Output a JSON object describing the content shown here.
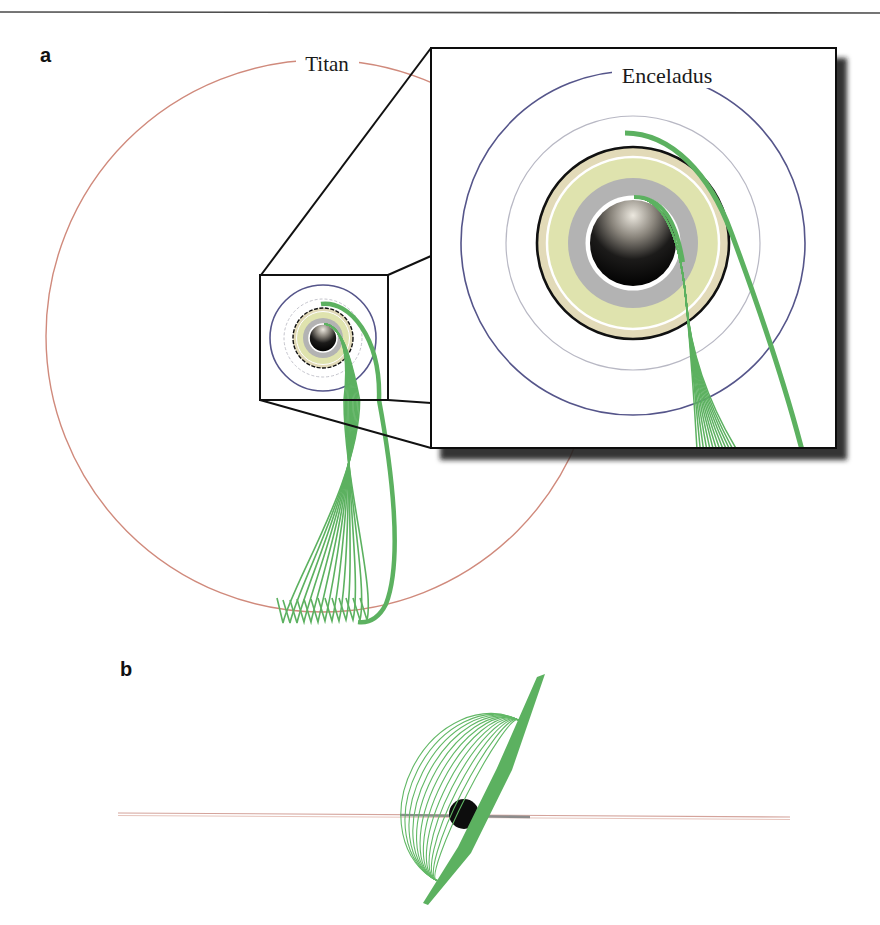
{
  "figure": {
    "panels": [
      {
        "id": "a",
        "label": "a",
        "view": "top-down (face-on) view of Saturn system with zoomed inset"
      },
      {
        "id": "b",
        "label": "b",
        "view": "edge-on side view"
      }
    ],
    "labels": {
      "titan": "Titan",
      "enceladus": "Enceladus"
    },
    "elements": {
      "titan_orbit": "large red-brown circle",
      "enceladus_orbit": "blue circle",
      "inner_orbit": "thin grey circle",
      "rings": "beige / pale green / grey concentric ring bands",
      "planet": "shaded black sphere",
      "trajectories": "green bundle of trajectory curves",
      "inset": "zoomed square inset with drop shadow"
    }
  },
  "colors": {
    "titan_orbit": "#d08a7c",
    "enceladus_orbit": "#55558a",
    "inner_orbit": "#b8b8c4",
    "ring_outer": "#e2dab8",
    "ring_inner": "#dfe3ae",
    "ring_grey": "#b3b3b3",
    "trajectory_green": "#5cb160",
    "frame": "#111111"
  }
}
